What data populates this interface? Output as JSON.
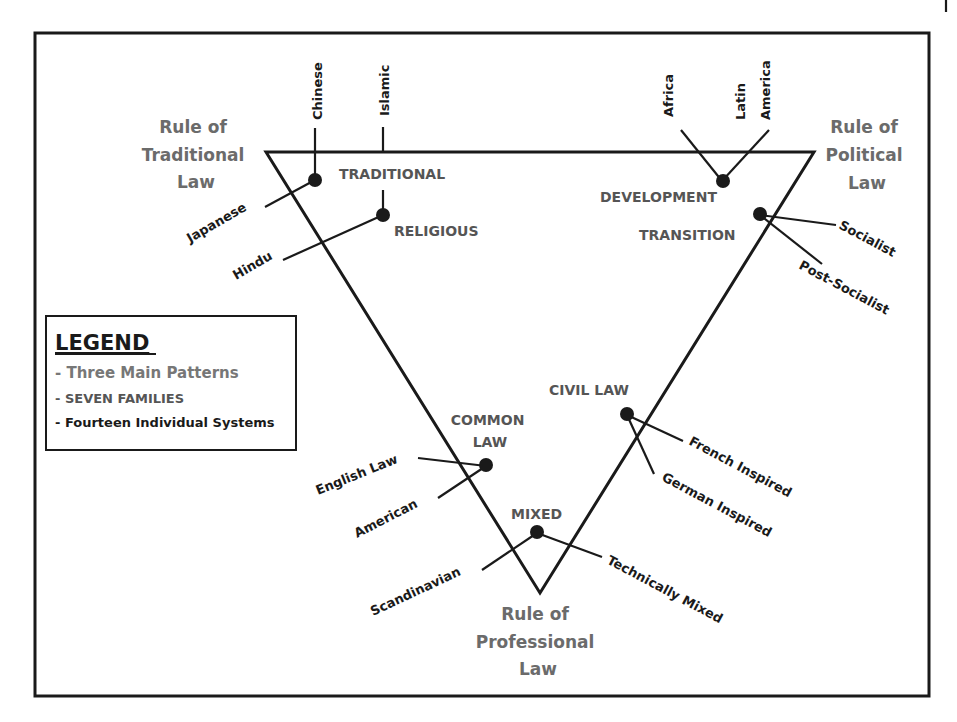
{
  "diagram": {
    "patterns": {
      "traditional": [
        "Rule of",
        "Traditional",
        "Law"
      ],
      "political": [
        "Rule of",
        "Political",
        "Law"
      ],
      "professional": [
        "Rule of",
        "Professional",
        "Law"
      ]
    },
    "families": {
      "traditional": "TRADITIONAL",
      "religious": "RELIGIOUS",
      "development": "DEVELOPMENT",
      "transition": "TRANSITION",
      "civil_law": "CIVIL LAW",
      "common_law": [
        "COMMON",
        "LAW"
      ],
      "mixed": "MIXED"
    },
    "systems": {
      "chinese": "Chinese",
      "islamic": "Islamic",
      "japanese": "Japanese",
      "hindu": "Hindu",
      "africa": "Africa",
      "latin_america": [
        "Latin",
        "America"
      ],
      "socialist": "Socialist",
      "post_socialist": "Post-Socialist",
      "french_inspired": "French Inspired",
      "german_inspired": "German Inspired",
      "english_law": "English Law",
      "american": "American",
      "scandinavian": "Scandinavian",
      "technically_mixed": "Technically Mixed"
    },
    "legend": {
      "title": "LEGEND",
      "items": [
        "- Three Main Patterns",
        "- SEVEN FAMILIES",
        "- Fourteen Individual Systems"
      ]
    },
    "colors": {
      "line": "#1a1a1a",
      "pattern_text": "#6b6b6b",
      "family_text": "#555555"
    }
  }
}
